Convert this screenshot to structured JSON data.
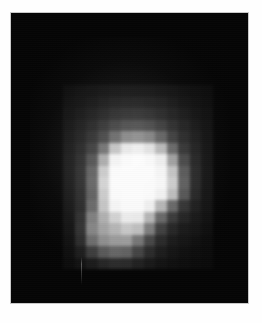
{
  "figure": {
    "title": "",
    "caption": ""
  },
  "image": {
    "background_color": "#050505",
    "frame_border_color": "#c9c9c9",
    "page_background_color": "#ffffff",
    "plate_left": 10,
    "plate_top": 12,
    "plate_width": 239,
    "plate_height": 292
  },
  "artifacts": {
    "scan_streak": {
      "name": "vertical-scan-streak",
      "left": 70,
      "top": 244,
      "height": 28
    },
    "halo": {
      "name": "diffuse-halo",
      "description": "soft unresolved glow surrounding the core"
    }
  },
  "chart_data": {
    "type": "heatmap",
    "title": "",
    "subtitle": "",
    "xlabel": "",
    "ylabel": "",
    "colormap": "grayscale",
    "value_range": [
      0,
      255
    ],
    "grid": false,
    "legend": "none",
    "cell_size_px": 11.5,
    "origin_x_px": 52,
    "origin_y_px": 72,
    "cols": 13,
    "rows": 16,
    "xticklabels": [],
    "yticklabels": [],
    "values": [
      [
        6,
        7,
        8,
        9,
        10,
        11,
        11,
        11,
        10,
        9,
        8,
        7,
        6
      ],
      [
        7,
        9,
        11,
        14,
        17,
        19,
        20,
        19,
        17,
        14,
        11,
        9,
        7
      ],
      [
        9,
        12,
        16,
        21,
        27,
        31,
        33,
        31,
        27,
        21,
        16,
        12,
        9
      ],
      [
        11,
        16,
        23,
        33,
        46,
        56,
        60,
        56,
        46,
        33,
        23,
        16,
        11
      ],
      [
        13,
        20,
        31,
        50,
        86,
        118,
        126,
        116,
        84,
        50,
        31,
        20,
        13
      ],
      [
        15,
        25,
        44,
        96,
        186,
        228,
        236,
        222,
        176,
        92,
        42,
        24,
        14
      ],
      [
        17,
        31,
        66,
        160,
        242,
        250,
        252,
        248,
        236,
        152,
        62,
        29,
        15
      ],
      [
        18,
        35,
        84,
        196,
        250,
        252,
        252,
        251,
        244,
        190,
        80,
        33,
        16
      ],
      [
        18,
        36,
        90,
        206,
        251,
        252,
        252,
        251,
        246,
        200,
        86,
        34,
        16
      ],
      [
        17,
        34,
        86,
        198,
        250,
        252,
        252,
        250,
        240,
        184,
        78,
        31,
        15
      ],
      [
        16,
        33,
        96,
        192,
        244,
        250,
        250,
        238,
        176,
        96,
        44,
        24,
        13
      ],
      [
        15,
        40,
        120,
        170,
        206,
        234,
        232,
        176,
        96,
        50,
        28,
        18,
        11
      ],
      [
        13,
        44,
        128,
        158,
        176,
        196,
        186,
        118,
        56,
        30,
        19,
        14,
        9
      ],
      [
        11,
        38,
        104,
        138,
        150,
        152,
        112,
        64,
        34,
        20,
        14,
        10,
        7
      ],
      [
        9,
        24,
        56,
        84,
        96,
        92,
        62,
        36,
        22,
        14,
        10,
        8,
        6
      ],
      [
        7,
        13,
        22,
        32,
        38,
        36,
        27,
        19,
        13,
        10,
        8,
        6,
        5
      ]
    ]
  }
}
